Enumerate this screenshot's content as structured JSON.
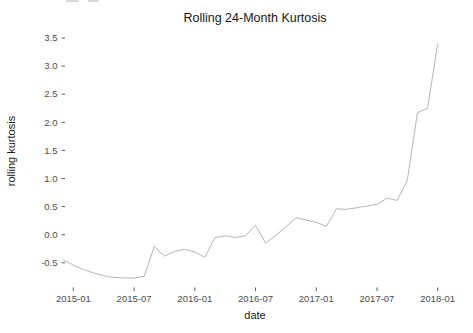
{
  "chart_data": {
    "type": "line",
    "title": "Rolling 24-Month Kurtosis",
    "xlabel": "date",
    "ylabel": "rolling kurtosis",
    "series_name": "rolling kurtosis",
    "x": [
      "2014-12",
      "2015-01",
      "2015-02",
      "2015-03",
      "2015-04",
      "2015-05",
      "2015-06",
      "2015-07",
      "2015-08",
      "2015-09",
      "2015-10",
      "2015-11",
      "2015-12",
      "2016-01",
      "2016-02",
      "2016-03",
      "2016-04",
      "2016-05",
      "2016-06",
      "2016-07",
      "2016-08",
      "2016-09",
      "2016-10",
      "2016-11",
      "2016-12",
      "2017-01",
      "2017-02",
      "2017-03",
      "2017-04",
      "2017-05",
      "2017-06",
      "2017-07",
      "2017-08",
      "2017-09",
      "2017-10",
      "2017-11",
      "2017-12",
      "2018-01"
    ],
    "values": [
      -0.45,
      -0.54,
      -0.62,
      -0.68,
      -0.73,
      -0.76,
      -0.77,
      -0.77,
      -0.74,
      -0.21,
      -0.38,
      -0.3,
      -0.26,
      -0.31,
      -0.4,
      -0.05,
      -0.02,
      -0.05,
      -0.02,
      0.17,
      -0.15,
      -0.01,
      0.14,
      0.3,
      0.26,
      0.22,
      0.15,
      0.46,
      0.45,
      0.48,
      0.51,
      0.54,
      0.65,
      0.61,
      0.97,
      2.17,
      2.25,
      3.4
    ],
    "x_tick_labels": [
      "2015-01",
      "2015-07",
      "2016-01",
      "2016-07",
      "2017-01",
      "2017-07",
      "2018-01"
    ],
    "y_tick_labels": [
      "3.5",
      "3.0",
      "2.5",
      "2.0",
      "1.5",
      "1.0",
      "0.5",
      "0.0",
      "-0.5"
    ],
    "ylim": [
      -0.9,
      3.6
    ],
    "grid": false,
    "legend": "none",
    "line_color": "#b5b5b5",
    "tick_mark_color": "#333333",
    "tick_text_color": "#4d4d4d",
    "title_color": "#171717",
    "background_color": "#ffffff"
  }
}
